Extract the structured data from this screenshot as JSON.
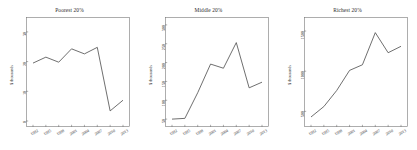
{
  "figure": {
    "background_color": "#ffffff",
    "line_color": "#4a4a4a",
    "axis_color": "#777777",
    "text_color": "#2b2b2b"
  },
  "chart_data": [
    {
      "type": "line",
      "title": "Poorest 20%",
      "xlabel": "",
      "ylabel": "$ thousands",
      "grid": false,
      "legend": "none",
      "x": [
        1992,
        1995,
        1998,
        2001,
        2004,
        2007,
        2010,
        2013
      ],
      "xticklabels": [
        "1992",
        "1995",
        "1998",
        "2001",
        "2004",
        "2007",
        "2010",
        "2013"
      ],
      "yticklabels": [
        "0",
        "10",
        "20",
        "30"
      ],
      "ytickvalues": [
        0,
        10,
        20,
        30
      ],
      "ylim": [
        0,
        33
      ],
      "values": [
        19.5,
        21.5,
        19.8,
        24.3,
        22.6,
        24.8,
        3.4,
        7.0
      ]
    },
    {
      "type": "line",
      "title": "Middle 20%",
      "xlabel": "",
      "ylabel": "$ thousands",
      "grid": false,
      "legend": "none",
      "x": [
        1992,
        1995,
        1998,
        2001,
        2004,
        2007,
        2010,
        2013
      ],
      "xticklabels": [
        "1992",
        "1995",
        "1998",
        "2001",
        "2004",
        "2007",
        "2010",
        "2013"
      ],
      "yticklabels": [
        "50",
        "100",
        "150",
        "200",
        "250",
        "300"
      ],
      "ytickvalues": [
        50,
        100,
        150,
        200,
        250,
        300
      ],
      "ylim": [
        45,
        305
      ],
      "values": [
        50,
        52,
        120,
        196,
        185,
        253,
        133,
        148
      ]
    },
    {
      "type": "line",
      "title": "Richest 20%",
      "xlabel": "",
      "ylabel": "$ thousands",
      "grid": false,
      "legend": "none",
      "x": [
        1992,
        1995,
        1998,
        2001,
        2004,
        2007,
        2010,
        2013
      ],
      "xticklabels": [
        "1992",
        "1995",
        "1998",
        "2001",
        "2004",
        "2007",
        "2010",
        "2013"
      ],
      "yticklabels": [
        "500",
        "1000",
        "1500"
      ],
      "ytickvalues": [
        500,
        1000,
        1500
      ],
      "ylim": [
        380,
        1600
      ],
      "values": [
        430,
        560,
        760,
        1010,
        1080,
        1480,
        1230,
        1310
      ]
    }
  ]
}
